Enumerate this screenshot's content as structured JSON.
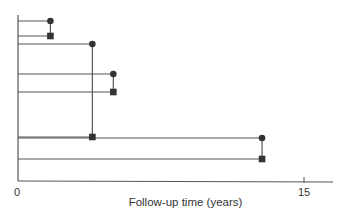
{
  "chart_data": {
    "type": "line",
    "title": "",
    "xlabel": "Follow-up time (years)",
    "ylabel": "",
    "xlim": [
      0,
      16
    ],
    "x_ticks": [
      0,
      15
    ],
    "x_tick_labels": [
      "0",
      "15"
    ],
    "grid": false,
    "legend": null,
    "rows": [
      {
        "row": 1,
        "end": 1.7,
        "marker": "circle"
      },
      {
        "row": 2,
        "end": 1.7,
        "marker": "square"
      },
      {
        "row": 3,
        "end": 3.9,
        "marker": "circle"
      },
      {
        "row": 4,
        "end": 5.0,
        "marker": "circle"
      },
      {
        "row": 5,
        "end": 5.0,
        "marker": "square"
      },
      {
        "row": 6,
        "end": 3.9,
        "marker": "square"
      },
      {
        "row": 7,
        "end": 12.8,
        "marker": "circle"
      },
      {
        "row": 8,
        "end": 12.8,
        "marker": "square"
      }
    ],
    "pairs": [
      [
        1,
        2
      ],
      [
        3,
        6
      ],
      [
        4,
        5
      ],
      [
        7,
        8
      ]
    ]
  },
  "axis": {
    "tick0": "0",
    "tick15": "15"
  },
  "colors": {
    "line": "#555555",
    "marker": "#333333"
  }
}
